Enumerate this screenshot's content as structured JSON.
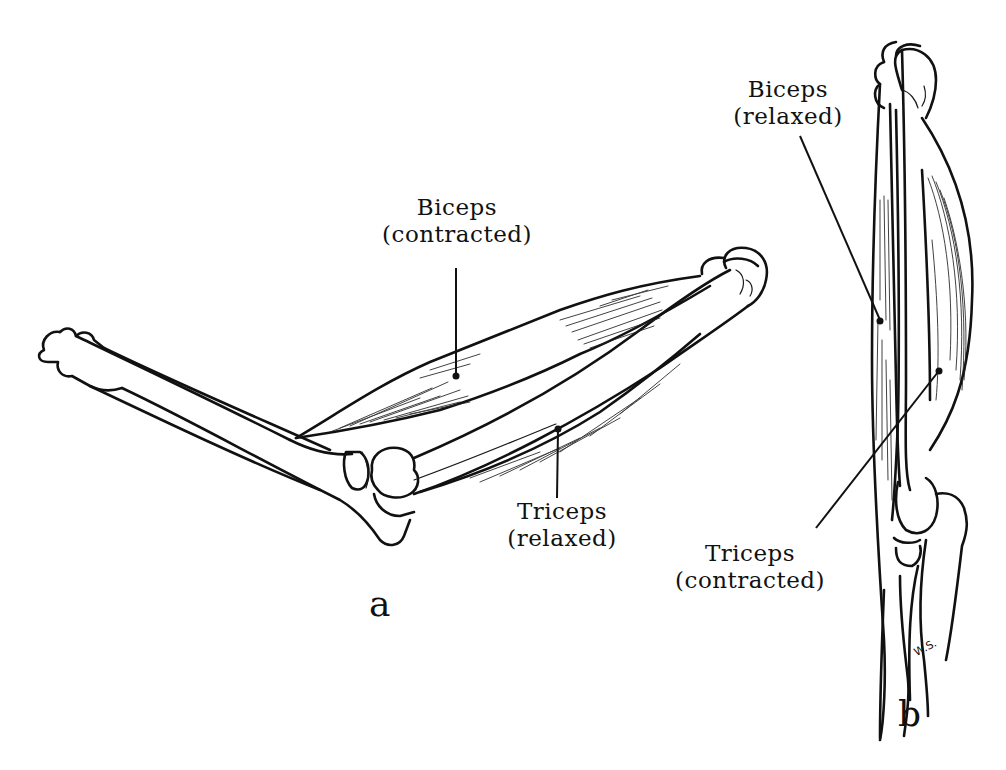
{
  "figure": {
    "panels": [
      {
        "id": "a",
        "letter": "a",
        "description": "Bent arm: biceps contracted, triceps relaxed",
        "labels": [
          {
            "name": "biceps",
            "line1": "Biceps",
            "line2": "(contracted)"
          },
          {
            "name": "triceps",
            "line1": "Triceps",
            "line2": "(relaxed)"
          }
        ]
      },
      {
        "id": "b",
        "letter": "b",
        "description": "Straight arm: biceps relaxed, triceps contracted",
        "labels": [
          {
            "name": "biceps",
            "line1": "Biceps",
            "line2": "(relaxed)"
          },
          {
            "name": "triceps",
            "line1": "Triceps",
            "line2": "(contracted)"
          }
        ]
      }
    ],
    "signature": "W.S.",
    "colors": {
      "ink": "#111111",
      "background": "#ffffff"
    }
  }
}
